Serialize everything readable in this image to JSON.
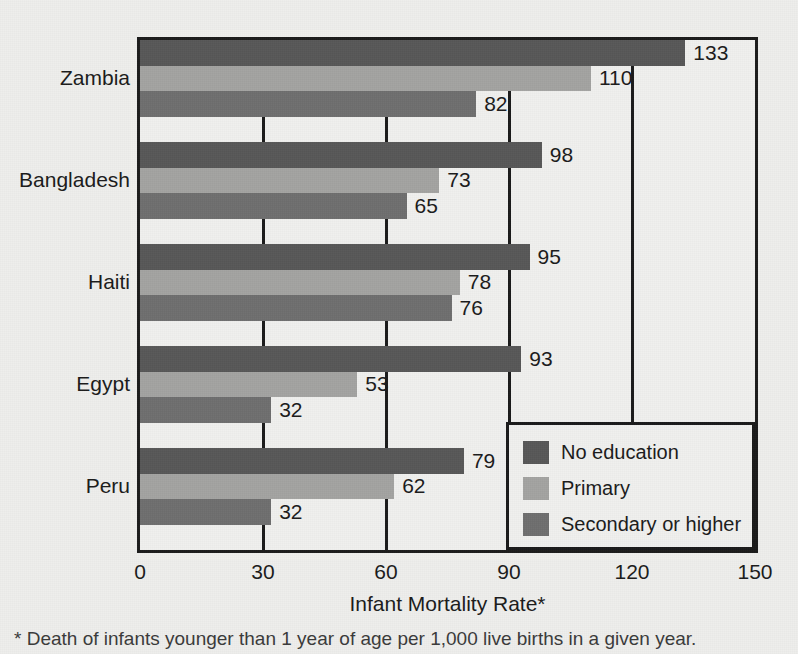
{
  "chart_data": {
    "type": "bar",
    "orientation": "horizontal",
    "title": "",
    "xlabel": "Infant Mortality Rate*",
    "ylabel": "",
    "xlim": [
      0,
      150
    ],
    "xticks": [
      0,
      30,
      60,
      90,
      120,
      150
    ],
    "grid": true,
    "grid_axis": "x",
    "legend_position": "inside-bottom-right",
    "categories": [
      "Zambia",
      "Bangladesh",
      "Haiti",
      "Egypt",
      "Peru"
    ],
    "series": [
      {
        "name": "No education",
        "color": "#575757",
        "values": [
          133,
          98,
          95,
          93,
          79
        ]
      },
      {
        "name": "Primary",
        "color": "#a3a3a1",
        "values": [
          110,
          73,
          78,
          53,
          62
        ]
      },
      {
        "name": "Secondary or higher",
        "color": "#6e6e6e",
        "values": [
          82,
          65,
          76,
          32,
          32
        ]
      }
    ],
    "footnote": "* Death of infants younger than 1 year of age per 1,000 live births in a given year."
  },
  "axis": {
    "tick_labels": [
      "0",
      "30",
      "60",
      "90",
      "120",
      "150"
    ],
    "x_title": "Infant Mortality Rate*"
  },
  "legend": {
    "items": [
      {
        "label": "No education"
      },
      {
        "label": "Primary"
      },
      {
        "label": "Secondary or higher"
      }
    ]
  },
  "footnote": {
    "text": "* Death of infants younger than 1 year of age per 1,000 live births in a given year."
  },
  "colors": {
    "no_education": "#575757",
    "primary": "#a3a3a1",
    "secondary_or_higher": "#6e6e6e",
    "axis": "#1a1a1a",
    "background": "#eeeeec"
  }
}
